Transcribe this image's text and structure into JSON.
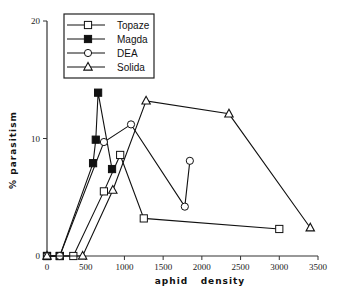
{
  "chart_data": {
    "type": "line",
    "title": "",
    "xlabel": "aphid   density",
    "ylabel": "%   parasitism",
    "xlim": [
      0,
      3500
    ],
    "ylim": [
      0,
      20
    ],
    "xticks": [
      0,
      500,
      1000,
      1500,
      2000,
      2500,
      3000,
      3500
    ],
    "yticks": [
      0,
      10,
      20
    ],
    "grid": false,
    "legend_position": "upper-left-inside",
    "series": [
      {
        "name": "Topaze",
        "marker": "open-square",
        "x": [
          0,
          165,
          340,
          735,
          945,
          1250,
          3000
        ],
        "y": [
          0,
          0,
          0,
          5.5,
          8.6,
          3.2,
          2.3
        ]
      },
      {
        "name": "Magda",
        "marker": "filled-square",
        "x": [
          0,
          165,
          595,
          630,
          660,
          840
        ],
        "y": [
          0,
          0,
          7.9,
          9.9,
          13.9,
          7.4
        ]
      },
      {
        "name": "DEA",
        "marker": "open-circle",
        "x": [
          0,
          165,
          735,
          1085,
          1780,
          1845
        ],
        "y": [
          0,
          0,
          9.7,
          11.2,
          4.2,
          8.1
        ]
      },
      {
        "name": "Solida",
        "marker": "open-triangle",
        "x": [
          0,
          460,
          850,
          1280,
          2350,
          3400
        ],
        "y": [
          0,
          0,
          5.6,
          13.2,
          12.1,
          2.4
        ]
      }
    ]
  }
}
